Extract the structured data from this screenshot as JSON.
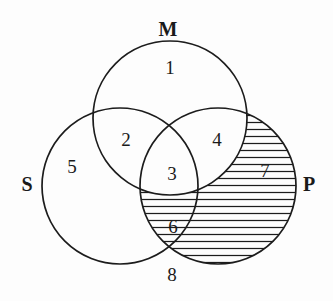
{
  "figure": {
    "type": "venn-diagram",
    "title": "",
    "background_color": "#fdfdfd",
    "stroke_color": "#1c1c1c",
    "text_color": "#1a1a1a",
    "set_count": 3
  },
  "sets": [
    {
      "id": "M",
      "label": "M",
      "label_x": 168,
      "label_y": 31,
      "cx": 170,
      "cy": 118,
      "r": 77
    },
    {
      "id": "S",
      "label": "S",
      "label_x": 27,
      "label_y": 186,
      "cx": 120,
      "cy": 186,
      "r": 78
    },
    {
      "id": "P",
      "label": "P",
      "label_x": 309,
      "label_y": 186,
      "cx": 218,
      "cy": 186,
      "r": 78
    }
  ],
  "regions": [
    {
      "id": "r1",
      "label": "1",
      "x": 170,
      "y": 70,
      "membership": "M only",
      "shaded": false
    },
    {
      "id": "r2",
      "label": "2",
      "x": 126,
      "y": 142,
      "membership": "M and S",
      "shaded": false
    },
    {
      "id": "r3",
      "label": "3",
      "x": 172,
      "y": 176,
      "membership": "M, S and P",
      "shaded": false
    },
    {
      "id": "r4",
      "label": "4",
      "x": 217,
      "y": 142,
      "membership": "M and P",
      "shaded": false
    },
    {
      "id": "r5",
      "label": "5",
      "x": 72,
      "y": 169,
      "membership": "S only",
      "shaded": false
    },
    {
      "id": "r6",
      "label": "6",
      "x": 173,
      "y": 229,
      "membership": "S and P",
      "shaded": true
    },
    {
      "id": "r7",
      "label": "7",
      "x": 265,
      "y": 173,
      "membership": "P only",
      "shaded": true
    },
    {
      "id": "r8",
      "label": "8",
      "x": 172,
      "y": 277,
      "membership": "outside all sets",
      "shaded": false
    }
  ],
  "shading": {
    "style": "horizontal-lines",
    "description": "P minus M",
    "line_spacing_px": 7,
    "line_color": "#1c1c1c"
  },
  "chart_data": {
    "type": "venn",
    "title": "",
    "sets": [
      "M",
      "S",
      "P"
    ],
    "region_labels": [
      "1",
      "2",
      "3",
      "4",
      "5",
      "6",
      "7",
      "8"
    ],
    "shaded_regions": [
      "6",
      "7"
    ],
    "legend": []
  }
}
